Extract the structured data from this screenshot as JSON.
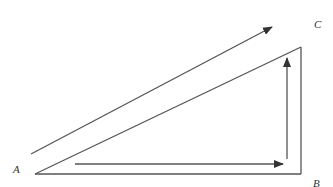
{
  "figure": {
    "type": "right-triangle vector path diagram",
    "vertices": {
      "A": {
        "label": "A",
        "x": 35,
        "y": 174
      },
      "B": {
        "label": "B",
        "x": 301,
        "y": 174
      },
      "C": {
        "label": "C",
        "x": 301,
        "y": 47
      }
    },
    "sides": [
      {
        "from": "A",
        "to": "B",
        "name": "bottom-side"
      },
      {
        "from": "B",
        "to": "C",
        "name": "right-side"
      },
      {
        "from": "A",
        "to": "C",
        "name": "hypotenuse"
      }
    ],
    "arrows": [
      {
        "name": "direct-path-arrow",
        "direction": "A to C",
        "x1": 31,
        "y1": 154,
        "x2": 272,
        "y2": 27
      },
      {
        "name": "horizontal-path-arrow",
        "direction": "A to B",
        "x1": 75,
        "y1": 164,
        "x2": 283,
        "y2": 164
      },
      {
        "name": "vertical-path-arrow",
        "direction": "B to C",
        "x1": 287,
        "y1": 159,
        "x2": 287,
        "y2": 58
      }
    ],
    "colors": {
      "line": "#444444",
      "background": "#ffffff",
      "label": "#333333"
    }
  },
  "labels": {
    "a": "A",
    "b": "B",
    "c": "C"
  }
}
